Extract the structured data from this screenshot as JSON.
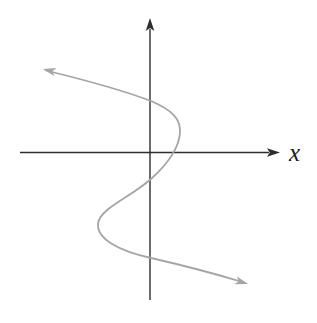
{
  "figure": {
    "axis_label_x": "x",
    "colors": {
      "background": "#ffffff",
      "axis": "#2d2d2d",
      "curve": "#a5a5a5",
      "label": "#1c1c1c"
    },
    "geometry": {
      "y_axis_d": "M 150 29 L 150 300",
      "y_axis_arrow_points": "150,18 145.7,31 150,28 154.3,31",
      "x_axis_d": "M 20 152.5 L 269 152.5",
      "x_axis_arrow_points": "280,152.5 267,148.2 269.8,152.5 267,156.8",
      "curve_d": "M 46 70.5 C 85 80, 122 90, 151 101 C 172 110, 181 119, 180 133 C 179 145, 171 161, 151 179 C 128 199, 99 209, 98 224 C 97 239, 119 251, 151 258 C 186 266, 216 274, 244 282.5",
      "curve_start_arrow_points": "43,69 56.6,68 52.2,71.3 54.6,76.2",
      "curve_end_arrow_points": "248,284 234.4,284.2 238.9,281.2 236.8,276.2"
    }
  }
}
